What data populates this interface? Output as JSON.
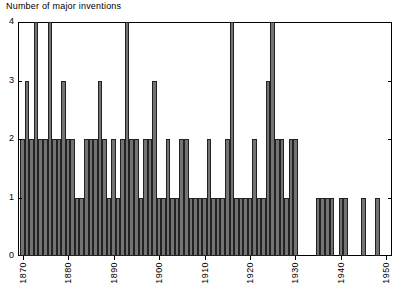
{
  "chart_data": {
    "type": "bar",
    "title": "",
    "ylabel": "Number of major inventions",
    "xlabel": "",
    "ylim": [
      0,
      4
    ],
    "xlim": [
      1869,
      1951
    ],
    "grid": false,
    "legend": null,
    "ytick_labels": [
      "0",
      "1",
      "2",
      "3",
      "4"
    ],
    "ytick_values": [
      0,
      1,
      2,
      3,
      4
    ],
    "xtick_labels": [
      "1870",
      "1880",
      "1890",
      "1900",
      "1910",
      "1920",
      "1930",
      "1940",
      "1950"
    ],
    "xtick_values": [
      1870,
      1880,
      1890,
      1900,
      1910,
      1920,
      1930,
      1940,
      1950
    ],
    "categories": [
      1870,
      1871,
      1872,
      1873,
      1874,
      1875,
      1876,
      1877,
      1878,
      1879,
      1880,
      1881,
      1882,
      1883,
      1884,
      1885,
      1886,
      1887,
      1888,
      1889,
      1890,
      1891,
      1892,
      1893,
      1894,
      1895,
      1896,
      1897,
      1898,
      1899,
      1900,
      1901,
      1902,
      1903,
      1904,
      1905,
      1906,
      1907,
      1908,
      1909,
      1910,
      1911,
      1912,
      1913,
      1914,
      1915,
      1916,
      1917,
      1918,
      1919,
      1920,
      1921,
      1922,
      1923,
      1924,
      1925,
      1926,
      1927,
      1928,
      1929,
      1930,
      1931,
      1932,
      1933,
      1934,
      1935,
      1936,
      1937,
      1938,
      1939,
      1940,
      1941,
      1942,
      1943,
      1944,
      1945,
      1946,
      1947,
      1948,
      1949,
      1950
    ],
    "values": [
      2,
      3,
      2,
      4,
      2,
      2,
      4,
      2,
      2,
      3,
      2,
      2,
      1,
      1,
      2,
      2,
      2,
      3,
      2,
      1,
      2,
      1,
      2,
      4,
      2,
      2,
      1,
      2,
      2,
      3,
      1,
      1,
      2,
      1,
      1,
      2,
      2,
      1,
      1,
      1,
      1,
      2,
      1,
      1,
      1,
      2,
      4,
      1,
      1,
      1,
      1,
      2,
      1,
      1,
      3,
      4,
      2,
      2,
      1,
      2,
      2,
      0,
      0,
      0,
      0,
      1,
      1,
      1,
      1,
      0,
      1,
      1,
      0,
      0,
      0,
      1,
      0,
      0,
      1,
      0,
      0
    ]
  },
  "axis": {
    "y_axis_name": "y-axis",
    "x_axis_name": "x-axis"
  }
}
